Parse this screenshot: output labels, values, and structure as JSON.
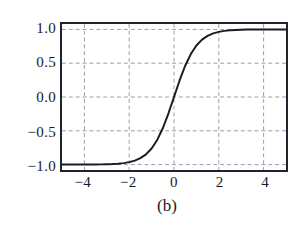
{
  "figure": {
    "caption": "(b)",
    "background_color": "#ffffff",
    "frame_color": "#22222e",
    "grid_color": "#9a9aa6",
    "curve_color": "#1a1a22"
  },
  "chart_data": {
    "type": "line",
    "title": "",
    "subtitle": "",
    "xlabel": "",
    "ylabel": "",
    "xlim": [
      -5,
      5
    ],
    "ylim": [
      -1.08,
      1.08
    ],
    "grid": true,
    "grid_style": "dashed",
    "legend": null,
    "legend_position": "none",
    "annotations": [
      "(b)"
    ],
    "xticks": [
      -4,
      -2,
      0,
      2,
      4
    ],
    "xtick_labels": [
      "−4",
      "−2",
      "0",
      "2",
      "4"
    ],
    "yticks": [
      1.0,
      0.5,
      0.0,
      -0.5,
      -1.0
    ],
    "ytick_labels": [
      "1.0",
      "0.5",
      "0.0",
      "−0.5",
      "−1.0"
    ],
    "series": [
      {
        "name": "tanh",
        "x": [
          -5.0,
          -4.75,
          -4.5,
          -4.25,
          -4.0,
          -3.75,
          -3.5,
          -3.25,
          -3.0,
          -2.75,
          -2.5,
          -2.25,
          -2.0,
          -1.75,
          -1.5,
          -1.25,
          -1.0,
          -0.75,
          -0.5,
          -0.25,
          0.0,
          0.25,
          0.5,
          0.75,
          1.0,
          1.25,
          1.5,
          1.75,
          2.0,
          2.25,
          2.5,
          2.75,
          3.0,
          3.25,
          3.5,
          3.75,
          4.0,
          4.25,
          4.5,
          4.75,
          5.0
        ],
        "y": [
          -1.0,
          -1.0,
          -0.9999,
          -0.9998,
          -0.9993,
          -0.9989,
          -0.9982,
          -0.997,
          -0.995,
          -0.9919,
          -0.9866,
          -0.978,
          -0.964,
          -0.9414,
          -0.9051,
          -0.8483,
          -0.7616,
          -0.6351,
          -0.4621,
          -0.2449,
          0.0,
          0.2449,
          0.4621,
          0.6351,
          0.7616,
          0.8483,
          0.9051,
          0.9414,
          0.964,
          0.978,
          0.9866,
          0.9919,
          0.995,
          0.9982,
          0.9989,
          0.9993,
          0.9998,
          0.9999,
          1.0,
          1.0,
          1.0
        ]
      }
    ]
  }
}
